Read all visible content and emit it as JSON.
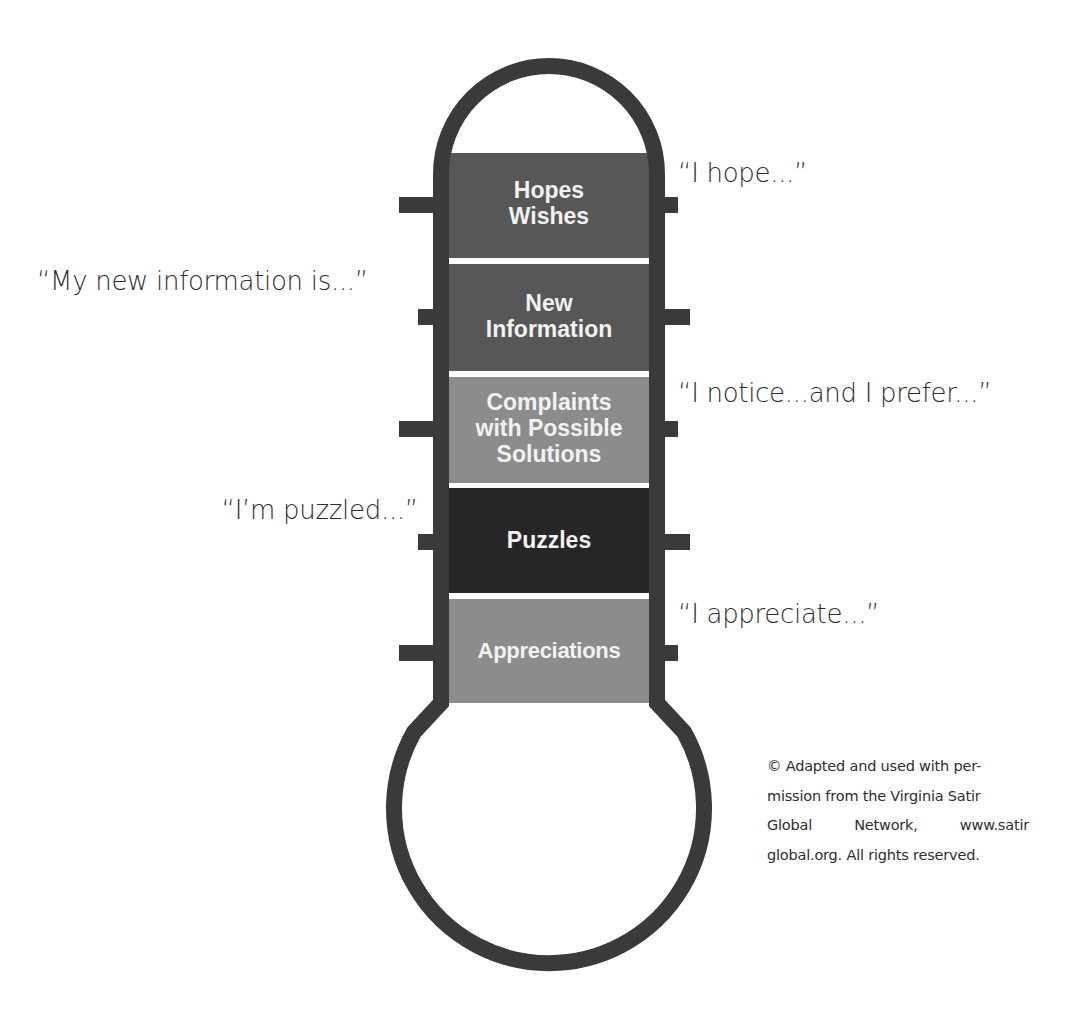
{
  "figure": {
    "type": "temperature-reading-thermometer",
    "colors": {
      "outline": "#3a3a3a",
      "dark_block": "#575757",
      "medium_block": "#8c8c8c",
      "darkest_block": "#262626",
      "separator": "#ffffff",
      "label_text": "#f2f2f2",
      "quote_text": "#2e2e2e"
    },
    "blocks": [
      {
        "label_lines": [
          "Hopes",
          "Wishes"
        ],
        "shade": "dark_block",
        "quote": "“I hope...”",
        "quote_side": "right"
      },
      {
        "label_lines": [
          "New",
          "Information"
        ],
        "shade": "dark_block",
        "quote": "“My new information is...”",
        "quote_side": "left"
      },
      {
        "label_lines": [
          "Complaints",
          "with Possible",
          "Solutions"
        ],
        "shade": "medium_block",
        "quote": "“I notice...and I prefer...”",
        "quote_side": "right"
      },
      {
        "label_lines": [
          "Puzzles"
        ],
        "shade": "darkest_block",
        "quote": "“I’m puzzled...”",
        "quote_side": "left"
      },
      {
        "label_lines": [
          "Appreciations"
        ],
        "shade": "medium_block",
        "quote": "“I appreciate...”",
        "quote_side": "right"
      }
    ]
  },
  "copyright": {
    "symbol": "©",
    "text": "Adapted and used with per-mission from the Virginia Satir Global Network, www.satir global.org. All rights reserved.",
    "lines": [
      "© Adapted and used with per-",
      "mission from the Virginia Satir",
      "Global  Network,  www.satir",
      "global.org. All rights reserved."
    ]
  }
}
